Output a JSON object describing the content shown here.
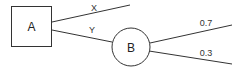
{
  "diagram": {
    "type": "decision-tree",
    "nodes": [
      {
        "id": "A",
        "label": "A",
        "shape": "square"
      },
      {
        "id": "B",
        "label": "B",
        "shape": "circle"
      }
    ],
    "edges": [
      {
        "from": "A",
        "to": null,
        "label": "X"
      },
      {
        "from": "A",
        "to": "B",
        "label": "Y"
      },
      {
        "from": "B",
        "to": null,
        "label": "0.7"
      },
      {
        "from": "B",
        "to": null,
        "label": "0.3"
      }
    ]
  },
  "colors": {
    "stroke": "#333333",
    "background": "#ffffff"
  }
}
